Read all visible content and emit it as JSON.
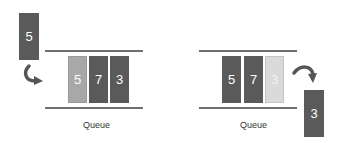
{
  "diagram": {
    "colors": {
      "dark_block": "#5a5a5a",
      "light_block": "#a8a8a8",
      "ghost_block": "#dadada",
      "rail": "#6e6e6e",
      "arrow": "#555555"
    },
    "enqueue_panel": {
      "incoming_block": "5",
      "queue_cells": [
        "5",
        "7",
        "3"
      ],
      "label": "Queue"
    },
    "dequeue_panel": {
      "queue_cells": [
        "5",
        "7",
        "3"
      ],
      "outgoing_block": "3",
      "label": "Queue"
    }
  }
}
